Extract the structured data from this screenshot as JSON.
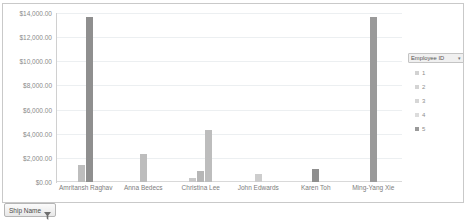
{
  "chart_data": {
    "type": "bar",
    "title": "",
    "xlabel": "",
    "ylabel": "",
    "ylim": [
      0,
      14000
    ],
    "grid": true,
    "legend_position": "right",
    "legend_title": "Employee ID",
    "categories": [
      "Amritansh Raghav",
      "Anna Bedecs",
      "Christina Lee",
      "John Edwards",
      "Karen Toh",
      "Ming-Yang Xie"
    ],
    "y_ticks": [
      "$14,000.00",
      "$12,000.00",
      "$10,000.00",
      "$8,000.00",
      "$6,000.00",
      "$4,000.00",
      "$2,000.00",
      "$0.00"
    ],
    "y_tick_values": [
      14000,
      12000,
      10000,
      8000,
      6000,
      4000,
      2000,
      0
    ],
    "series": [
      {
        "name": "1",
        "color": "#bdbdbd",
        "values": [
          1400,
          2300,
          350,
          0,
          0,
          0
        ]
      },
      {
        "name": "2",
        "color": "#bfbfbf",
        "values": [
          0,
          0,
          900,
          0,
          0,
          0
        ]
      },
      {
        "name": "3",
        "color": "#c2c2c2",
        "values": [
          0,
          0,
          4300,
          0,
          0,
          0
        ]
      },
      {
        "name": "4",
        "color": "#cdcdcd",
        "values": [
          0,
          0,
          0,
          700,
          0,
          0
        ]
      },
      {
        "name": "5",
        "color": "#8f8f8f",
        "values": [
          13700,
          0,
          0,
          0,
          1100,
          13700
        ]
      }
    ],
    "bars": [
      {
        "group": 0,
        "series": "1",
        "value": 1400,
        "color": "#bdbdbd"
      },
      {
        "group": 0,
        "series": "5",
        "value": 13700,
        "color": "#8f8f8f"
      },
      {
        "group": 1,
        "series": "1",
        "value": 2300,
        "color": "#bdbdbd"
      },
      {
        "group": 2,
        "series": "1",
        "value": 350,
        "color": "#c8c8c8"
      },
      {
        "group": 2,
        "series": "2",
        "value": 900,
        "color": "#b6b6b6"
      },
      {
        "group": 2,
        "series": "3",
        "value": 4300,
        "color": "#bdbdbd"
      },
      {
        "group": 3,
        "series": "4",
        "value": 700,
        "color": "#cdcdcd"
      },
      {
        "group": 4,
        "series": "5",
        "value": 1100,
        "color": "#8f8f8f"
      },
      {
        "group": 5,
        "series": "5",
        "value": 13700,
        "color": "#9a9a9a"
      }
    ]
  },
  "legend": {
    "title": "Employee ID",
    "caret": "▾",
    "items": [
      {
        "label": "1",
        "color": "#d2d2d2"
      },
      {
        "label": "2",
        "color": "#d4d4d4"
      },
      {
        "label": "3",
        "color": "#d6d6d6"
      },
      {
        "label": "4",
        "color": "#dcdcdc"
      },
      {
        "label": "5",
        "color": "#9a9a9a"
      }
    ]
  },
  "filter_button": {
    "label": "Ship Name",
    "icon": "filter-funnel-icon"
  },
  "colors": {
    "grid": "#eceff1",
    "axis": "#d0d0d0",
    "text": "#7d7d7d",
    "frame": "#c9c9c9"
  }
}
